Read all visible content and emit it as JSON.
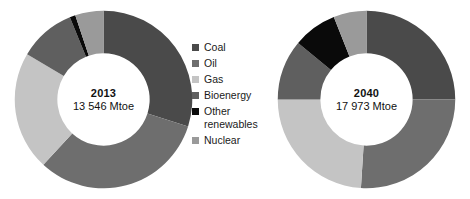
{
  "figure": {
    "background": "#ffffff"
  },
  "palette": {
    "coal": "#4a4a4a",
    "oil": "#6e6e6e",
    "gas": "#c4c4c4",
    "bioenergy": "#5f5f5f",
    "other_renewables": "#0a0a0a",
    "nuclear": "#9a9a9a"
  },
  "legend": {
    "position": "center",
    "items": [
      {
        "label": "Coal",
        "color": "#4a4a4a",
        "swatch_name": "legend-swatch-coal"
      },
      {
        "label": "Oil",
        "color": "#6e6e6e",
        "swatch_name": "legend-swatch-oil"
      },
      {
        "label": "Gas",
        "color": "#c4c4c4",
        "swatch_name": "legend-swatch-gas"
      },
      {
        "label": "Bioenergy",
        "color": "#5f5f5f",
        "swatch_name": "legend-swatch-bioenergy"
      },
      {
        "label": "Other\nrenewables",
        "color": "#0a0a0a",
        "swatch_name": "legend-swatch-other-renewables"
      },
      {
        "label": "Nuclear",
        "color": "#9a9a9a",
        "swatch_name": "legend-swatch-nuclear"
      }
    ]
  },
  "donuts": [
    {
      "id": "2013",
      "center_year": "2013",
      "center_value": "13 546 Mtoe"
    },
    {
      "id": "2040",
      "center_year": "2040",
      "center_value": "17 973 Mtoe"
    }
  ],
  "chart_data": [
    {
      "type": "pie",
      "variant": "donut",
      "title": "2013",
      "subtitle": "13 546 Mtoe",
      "total": 13546,
      "unit": "Mtoe",
      "start_angle": 0,
      "direction": "clockwise",
      "inner_radius_ratio": 0.52,
      "labels": [
        "Coal",
        "Oil",
        "Gas",
        "Bioenergy",
        "Other renewables",
        "Nuclear"
      ],
      "values": [
        29,
        31,
        21,
        10,
        1,
        5
      ],
      "unit_of_values": "percent",
      "colors": [
        "#4a4a4a",
        "#6e6e6e",
        "#c4c4c4",
        "#5f5f5f",
        "#0a0a0a",
        "#9a9a9a"
      ],
      "legend_position": "center",
      "grid": false
    },
    {
      "type": "pie",
      "variant": "donut",
      "title": "2040",
      "subtitle": "17 973 Mtoe",
      "total": 17973,
      "unit": "Mtoe",
      "start_angle": 0,
      "direction": "clockwise",
      "inner_radius_ratio": 0.52,
      "labels": [
        "Coal",
        "Oil",
        "Gas",
        "Bioenergy",
        "Other renewables",
        "Nuclear"
      ],
      "values": [
        25,
        26,
        24,
        11,
        8,
        6
      ],
      "unit_of_values": "percent",
      "colors": [
        "#4a4a4a",
        "#6e6e6e",
        "#c4c4c4",
        "#5f5f5f",
        "#0a0a0a",
        "#9a9a9a"
      ],
      "legend_position": "center",
      "grid": false
    }
  ]
}
